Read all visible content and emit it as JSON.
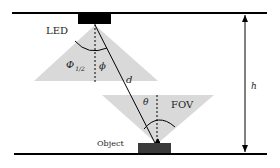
{
  "diagram": {
    "labels": {
      "led": "LED",
      "half_angle": "Φ",
      "half_angle_sub": "1/2",
      "phi": "ϕ",
      "distance": "d",
      "theta": "θ",
      "fov": "FOV",
      "object": "Object",
      "height": "h"
    },
    "colors": {
      "cone_fill": "#d9d9d9",
      "line": "#000000",
      "object_fill": "#3a3a3a",
      "led_fill": "#000000"
    }
  }
}
